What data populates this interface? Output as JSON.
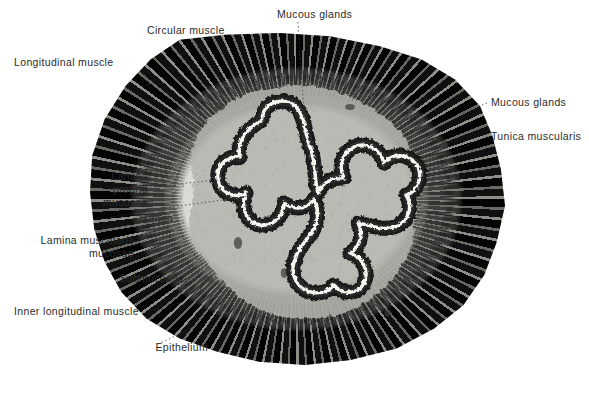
{
  "figure": {
    "kind": "labeled-histology-micrograph",
    "background_color": "#ffffff",
    "label_color": "#2b2b2b",
    "leader_line_color": "#3a3a3a"
  },
  "labels": [
    {
      "id": "longitudinal-muscle",
      "lines": [
        "Longitudinal muscle"
      ],
      "align": "left",
      "x": 14,
      "y": 56,
      "leader": [
        [
          140,
          70
        ],
        [
          146,
          78
        ],
        [
          150,
          88
        ]
      ],
      "dash": "1.5 2.5"
    },
    {
      "id": "circular-muscle",
      "lines": [
        "Circular muscle"
      ],
      "align": "left",
      "x": 147,
      "y": 24,
      "leader": [
        [
          193,
          38
        ],
        [
          200,
          50
        ],
        [
          205,
          60
        ]
      ],
      "dash": "1.5 2.5"
    },
    {
      "id": "mucous-glands-top",
      "lines": [
        "Mucous glands"
      ],
      "align": "left",
      "x": 277,
      "y": 8,
      "leader": [
        [
          298,
          22
        ],
        [
          300,
          60
        ],
        [
          303,
          100
        ],
        [
          306,
          128
        ]
      ],
      "dash": "1.5 2.5"
    },
    {
      "id": "mucous-glands-right",
      "lines": [
        "Mucous glands"
      ],
      "align": "left",
      "x": 491,
      "y": 96,
      "leader": [
        [
          487,
          103
        ],
        [
          470,
          110
        ],
        [
          455,
          116
        ]
      ],
      "dash": "1.5 2.5"
    },
    {
      "id": "tunica-muscularis",
      "lines": [
        "Tunica muscularis"
      ],
      "align": "left",
      "x": 491,
      "y": 130,
      "leader": [
        [
          487,
          136
        ],
        [
          466,
          146
        ],
        [
          448,
          154
        ]
      ],
      "dash": "1.5 2.5"
    },
    {
      "id": "lamina-propria-mucosae",
      "lines": [
        "Lamina",
        "propria",
        "mucosae"
      ],
      "align": "right",
      "x": 28,
      "y": 170,
      "leader": [
        [
          106,
          190
        ],
        [
          160,
          186
        ],
        [
          215,
          180
        ]
      ],
      "dash": "1.5 2.5"
    },
    {
      "id": "lumen",
      "lines": [
        "Lumen"
      ],
      "align": "right",
      "x": 53,
      "y": 212,
      "leader": [
        [
          106,
          218
        ],
        [
          180,
          206
        ],
        [
          250,
          196
        ]
      ],
      "dash": "1.5 2.5"
    },
    {
      "id": "lamina-muscularis-mucosae",
      "lines": [
        "Lamina muscularis",
        "mucosae"
      ],
      "align": "right",
      "x": 14,
      "y": 234,
      "leader": [
        [
          127,
          240
        ],
        [
          155,
          246
        ],
        [
          178,
          252
        ]
      ],
      "dash": "1.5 2.5"
    },
    {
      "id": "submucosa",
      "lines": [
        "Submucosa"
      ],
      "align": "right",
      "x": 58,
      "y": 272,
      "leader": [
        [
          118,
          278
        ],
        [
          155,
          276
        ],
        [
          196,
          272
        ]
      ],
      "dash": "1.5 2.5"
    },
    {
      "id": "inner-longitudinal-muscle",
      "lines": [
        "Inner longitudinal muscle"
      ],
      "align": "right",
      "x": 14,
      "y": 305,
      "leader": [
        [
          146,
          311
        ],
        [
          165,
          308
        ],
        [
          182,
          302
        ]
      ],
      "dash": "1.5 2.5"
    },
    {
      "id": "epithelium",
      "lines": [
        "Epithelium"
      ],
      "align": "right",
      "x": 88,
      "y": 341,
      "leader": [
        [
          158,
          344
        ],
        [
          180,
          334
        ],
        [
          198,
          324
        ]
      ],
      "dash": "1.5 2.5"
    }
  ],
  "structures": [
    {
      "id": "longitudinal-muscle",
      "name": "Longitudinal muscle"
    },
    {
      "id": "circular-muscle",
      "name": "Circular muscle"
    },
    {
      "id": "tunica-muscularis",
      "name": "Tunica muscularis"
    },
    {
      "id": "inner-longitudinal-muscle",
      "name": "Inner longitudinal muscle"
    },
    {
      "id": "submucosa",
      "name": "Submucosa"
    },
    {
      "id": "lamina-muscularis-mucosae",
      "name": "Lamina muscularis mucosae"
    },
    {
      "id": "lamina-propria-mucosae",
      "name": "Lamina propria mucosae"
    },
    {
      "id": "mucous-glands",
      "name": "Mucous glands"
    },
    {
      "id": "epithelium",
      "name": "Epithelium"
    },
    {
      "id": "lumen",
      "name": "Lumen"
    }
  ]
}
